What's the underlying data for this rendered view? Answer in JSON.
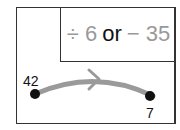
{
  "box": {
    "op1": "÷ 6",
    "connector": "or",
    "op2": "− 35"
  },
  "points": {
    "start": "42",
    "end": "7"
  },
  "colors": {
    "operation": "#999999",
    "arrow": "#999999",
    "dot": "#111111"
  }
}
